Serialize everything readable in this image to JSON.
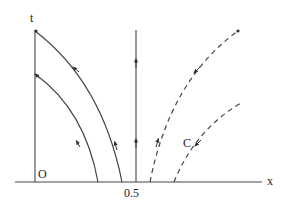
{
  "diagram": {
    "axes": {
      "x_label": "x",
      "t_label": "t",
      "origin_label": "O",
      "tick_label": "0.5"
    },
    "curve_label": "C",
    "colors": {
      "line": "#444444",
      "background": "#ffffff"
    },
    "curves": [
      {
        "name": "outer-solid-characteristic",
        "style": "solid"
      },
      {
        "name": "inner-solid-characteristic",
        "style": "solid"
      },
      {
        "name": "vertical-characteristic-at-0.5",
        "style": "solid"
      },
      {
        "name": "outer-dashed-characteristic",
        "style": "dashed"
      },
      {
        "name": "inner-dashed-characteristic-C",
        "style": "dashed"
      }
    ]
  }
}
